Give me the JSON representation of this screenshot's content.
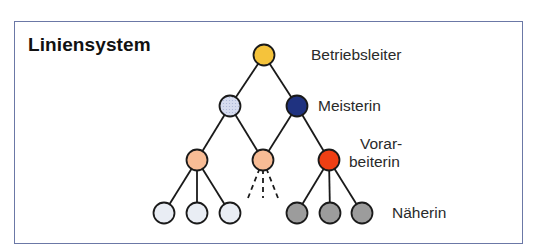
{
  "diagram": {
    "title": "Liniensystem",
    "levels": [
      {
        "label": "Betriebsleiter",
        "label_lines": [
          "Betriebsleiter"
        ]
      },
      {
        "label": "Meisterin",
        "label_lines": [
          "Meisterin"
        ]
      },
      {
        "label": "Vorarbeiterin",
        "label_lines": [
          "Vorar-",
          "beiterin"
        ]
      },
      {
        "label": "Näherin",
        "label_lines": [
          "Näherin"
        ]
      }
    ],
    "nodes": [
      {
        "id": "betriebsleiter",
        "level": 0,
        "cx": 264,
        "cy": 55,
        "fill": "#f5c33b",
        "pattern": "solid"
      },
      {
        "id": "meisterin-1",
        "level": 1,
        "cx": 230,
        "cy": 106,
        "fill": "#d6dcf0",
        "pattern": "dotted"
      },
      {
        "id": "meisterin-2",
        "level": 1,
        "cx": 297,
        "cy": 106,
        "fill": "#1f3280",
        "pattern": "solid"
      },
      {
        "id": "vorarbeiterin-1",
        "level": 2,
        "cx": 197,
        "cy": 160,
        "fill": "#f8bc95",
        "pattern": "solid"
      },
      {
        "id": "vorarbeiterin-2",
        "level": 2,
        "cx": 263,
        "cy": 160,
        "fill": "#f8bc95",
        "pattern": "solid"
      },
      {
        "id": "vorarbeiterin-3",
        "level": 2,
        "cx": 329,
        "cy": 160,
        "fill": "#ef3f14",
        "pattern": "solid"
      },
      {
        "id": "naeherin-1",
        "level": 3,
        "cx": 164,
        "cy": 213,
        "fill": "#e9edf4",
        "pattern": "solid"
      },
      {
        "id": "naeherin-2",
        "level": 3,
        "cx": 197,
        "cy": 213,
        "fill": "#e9edf4",
        "pattern": "solid"
      },
      {
        "id": "naeherin-3",
        "level": 3,
        "cx": 230,
        "cy": 213,
        "fill": "#e9edf4",
        "pattern": "solid"
      },
      {
        "id": "naeherin-4",
        "level": 3,
        "cx": 297,
        "cy": 213,
        "fill": "#9c9c9c",
        "pattern": "solid"
      },
      {
        "id": "naeherin-5",
        "level": 3,
        "cx": 330,
        "cy": 213,
        "fill": "#9c9c9c",
        "pattern": "solid"
      },
      {
        "id": "naeherin-6",
        "level": 3,
        "cx": 362,
        "cy": 213,
        "fill": "#9c9c9c",
        "pattern": "solid"
      }
    ],
    "edges": [
      {
        "from": "betriebsleiter",
        "to": "meisterin-1",
        "style": "solid"
      },
      {
        "from": "betriebsleiter",
        "to": "meisterin-2",
        "style": "solid"
      },
      {
        "from": "meisterin-1",
        "to": "vorarbeiterin-1",
        "style": "solid"
      },
      {
        "from": "meisterin-1",
        "to": "vorarbeiterin-2",
        "style": "solid"
      },
      {
        "from": "meisterin-2",
        "to": "vorarbeiterin-2",
        "style": "solid"
      },
      {
        "from": "meisterin-2",
        "to": "vorarbeiterin-3",
        "style": "solid"
      },
      {
        "from": "vorarbeiterin-1",
        "to": "naeherin-1",
        "style": "solid"
      },
      {
        "from": "vorarbeiterin-1",
        "to": "naeherin-2",
        "style": "solid"
      },
      {
        "from": "vorarbeiterin-1",
        "to": "naeherin-3",
        "style": "solid"
      },
      {
        "from": "vorarbeiterin-2",
        "to": "open-left",
        "style": "dashed"
      },
      {
        "from": "vorarbeiterin-2",
        "to": "open-middle",
        "style": "dashed"
      },
      {
        "from": "vorarbeiterin-2",
        "to": "open-right",
        "style": "dashed"
      },
      {
        "from": "vorarbeiterin-3",
        "to": "naeherin-4",
        "style": "solid"
      },
      {
        "from": "vorarbeiterin-3",
        "to": "naeherin-5",
        "style": "solid"
      },
      {
        "from": "vorarbeiterin-3",
        "to": "naeherin-6",
        "style": "solid"
      }
    ],
    "colors": {
      "frame_border": "#6b78a6",
      "line": "#1a1a1a",
      "node_stroke": "#1a1a1a"
    }
  }
}
